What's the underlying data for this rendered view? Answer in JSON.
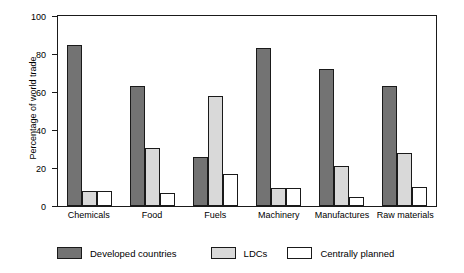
{
  "chart_data": {
    "type": "bar",
    "title": "",
    "xlabel": "",
    "ylabel": "Percentage of world trade",
    "ylim": [
      0,
      100
    ],
    "yticks": [
      0,
      20,
      40,
      60,
      80,
      100
    ],
    "grid": false,
    "legend_position": "bottom",
    "categories": [
      "Chemicals",
      "Food",
      "Fuels",
      "Machinery",
      "Manufactures",
      "Raw materials"
    ],
    "series": [
      {
        "name": "Developed countries",
        "color": "#737373",
        "values": [
          85,
          63,
          26,
          83,
          72,
          63
        ]
      },
      {
        "name": "LDCs",
        "color": "#d9d9d9",
        "values": [
          8,
          30.5,
          58,
          9.5,
          21,
          28
        ]
      },
      {
        "name": "Centrally planned",
        "color": "#ffffff",
        "values": [
          8,
          7,
          17,
          9.5,
          5,
          10
        ]
      }
    ]
  },
  "legend": {
    "items": [
      {
        "label": "Developed countries",
        "swatch": "dark-gray-swatch"
      },
      {
        "label": "LDCs",
        "swatch": "light-gray-swatch"
      },
      {
        "label": "Centrally planned",
        "swatch": "white-swatch"
      }
    ]
  }
}
